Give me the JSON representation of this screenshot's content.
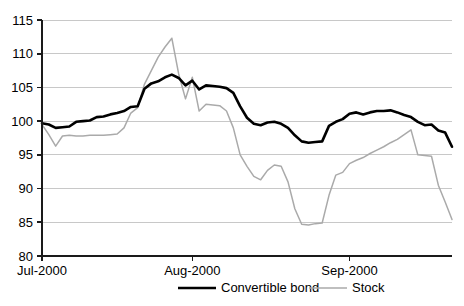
{
  "chart_data": {
    "type": "line",
    "title": "",
    "xlabel": "",
    "ylabel": "",
    "ylim": [
      80,
      115
    ],
    "y_ticks": [
      80,
      85,
      90,
      95,
      100,
      105,
      110,
      115
    ],
    "grid": true,
    "legend_position": "bottom",
    "x_tick_labels": [
      "Jul-2000",
      "Aug-2000",
      "Sep-2000"
    ],
    "x_tick_indices": [
      0,
      22,
      45
    ],
    "x_count": 61,
    "series": [
      {
        "name": "Convertible bond",
        "color": "#000000",
        "values": [
          99.7,
          99.5,
          99.0,
          99.1,
          99.2,
          99.9,
          100.0,
          100.1,
          100.6,
          100.7,
          101.0,
          101.2,
          101.5,
          102.1,
          102.2,
          104.8,
          105.6,
          105.9,
          106.5,
          106.9,
          106.4,
          105.3,
          106.0,
          104.7,
          105.3,
          105.2,
          105.1,
          104.9,
          104.2,
          102.2,
          100.5,
          99.6,
          99.4,
          99.8,
          99.9,
          99.6,
          99.0,
          97.9,
          97.0,
          96.8,
          96.9,
          97.0,
          99.3,
          99.9,
          100.3,
          101.1,
          101.3,
          101.0,
          101.3,
          101.5,
          101.5,
          101.6,
          101.3,
          100.9,
          100.6,
          99.9,
          99.4,
          99.5,
          98.6,
          98.3,
          96.2
        ]
      },
      {
        "name": "Stock",
        "color": "#aaaaaa",
        "values": [
          99.5,
          98.0,
          96.3,
          97.8,
          97.9,
          97.8,
          97.8,
          97.9,
          97.9,
          97.9,
          98.0,
          98.1,
          99.0,
          101.2,
          102.0,
          105.5,
          107.5,
          109.5,
          111.0,
          112.3,
          107.0,
          103.3,
          106.5,
          101.5,
          102.5,
          102.4,
          102.3,
          101.5,
          99.0,
          95.0,
          93.3,
          91.8,
          91.3,
          92.7,
          93.5,
          93.3,
          91.0,
          87.0,
          84.7,
          84.6,
          84.8,
          84.9,
          89.0,
          92.0,
          92.4,
          93.7,
          94.2,
          94.6,
          95.2,
          95.7,
          96.2,
          96.8,
          97.3,
          98.0,
          98.7,
          95.0,
          94.9,
          94.8,
          90.5,
          88.0,
          85.4
        ]
      }
    ]
  },
  "legend": {
    "items": [
      {
        "label": "Convertible bond"
      },
      {
        "label": "Stock"
      }
    ]
  }
}
